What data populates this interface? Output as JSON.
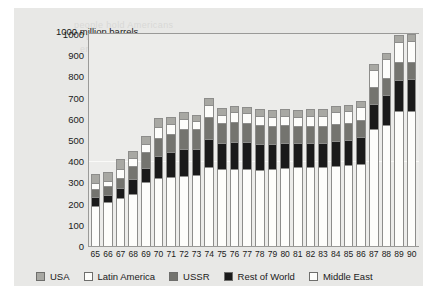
{
  "card": {
    "background": "#e8e8e6"
  },
  "ghost_text": {
    "line1": "people hold Americans",
    "line2": "to feel and differ",
    "line3": "energy consumption"
  },
  "chart_data": {
    "type": "bar",
    "stacked": true,
    "title": "",
    "ylabel": "1000 million barrels",
    "xlabel": "",
    "ylim": [
      0,
      1000
    ],
    "ytick_step": 100,
    "grid": false,
    "legend_position": "bottom-left",
    "yticks": [
      "1000",
      "900",
      "800",
      "700",
      "600",
      "500",
      "400",
      "300",
      "200",
      "100",
      "0"
    ],
    "categories": [
      "65",
      "66",
      "67",
      "68",
      "69",
      "70",
      "71",
      "72",
      "73",
      "74",
      "75",
      "76",
      "77",
      "78",
      "79",
      "80",
      "81",
      "82",
      "83",
      "84",
      "85",
      "86",
      "87",
      "88",
      "89",
      "90"
    ],
    "series": [
      {
        "name": "Middle East",
        "color": "#fdfdfb",
        "stack_order": 1,
        "values": [
          185,
          205,
          225,
          245,
          300,
          320,
          325,
          330,
          335,
          370,
          360,
          360,
          360,
          355,
          360,
          365,
          370,
          370,
          370,
          375,
          380,
          385,
          550,
          570,
          635,
          635
        ]
      },
      {
        "name": "Rest of World",
        "color": "#1a1a1a",
        "stack_order": 2,
        "values": [
          45,
          35,
          45,
          70,
          65,
          105,
          115,
          125,
          120,
          135,
          125,
          130,
          130,
          125,
          120,
          120,
          115,
          115,
          115,
          120,
          120,
          130,
          120,
          140,
          145,
          150
        ]
      },
      {
        "name": "USSR",
        "color": "#74746f",
        "stack_order": 3,
        "values": [
          40,
          40,
          50,
          60,
          80,
          85,
          90,
          95,
          95,
          105,
          95,
          95,
          90,
          90,
          85,
          85,
          80,
          80,
          80,
          80,
          80,
          80,
          80,
          80,
          85,
          80
        ]
      },
      {
        "name": "Latin America",
        "color": "#fdfdfb",
        "stack_order": 4,
        "values": [
          25,
          25,
          45,
          40,
          35,
          50,
          45,
          50,
          40,
          55,
          40,
          45,
          45,
          45,
          45,
          45,
          45,
          50,
          50,
          55,
          55,
          60,
          80,
          90,
          95,
          100
        ],
        "note": "Latin America"
      },
      {
        "name": "USA",
        "color": "#a8a8a3",
        "stack_order": 5,
        "values": [
          45,
          45,
          45,
          35,
          40,
          45,
          35,
          30,
          30,
          35,
          30,
          30,
          30,
          30,
          30,
          30,
          30,
          30,
          30,
          30,
          30,
          30,
          30,
          30,
          35,
          35
        ]
      }
    ],
    "totals": [
      340,
      350,
      410,
      450,
      520,
      605,
      610,
      630,
      620,
      700,
      650,
      660,
      655,
      645,
      640,
      645,
      640,
      645,
      645,
      660,
      665,
      685,
      860,
      910,
      995,
      1000
    ]
  },
  "legend": {
    "items": [
      {
        "label": "USA",
        "color": "#a8a8a3"
      },
      {
        "label": "Latin America",
        "color": "#fdfdfb"
      },
      {
        "label": "USSR",
        "color": "#74746f"
      },
      {
        "label": "Rest of World",
        "color": "#1a1a1a"
      },
      {
        "label": "Middle East",
        "color": "#fdfdfb"
      }
    ]
  }
}
